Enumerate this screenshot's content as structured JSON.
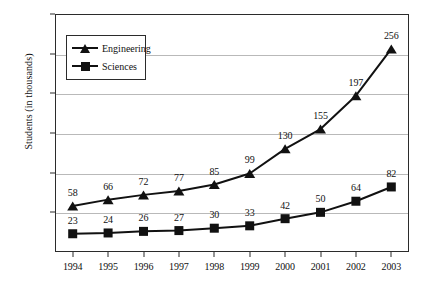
{
  "chart_data": {
    "type": "line",
    "title": "",
    "xlabel": "",
    "ylabel": "Students (in thousands)",
    "categories": [
      "1994",
      "1995",
      "1996",
      "1997",
      "1998",
      "1999",
      "2000",
      "2001",
      "2002",
      "2003"
    ],
    "series": [
      {
        "name": "Engineering",
        "marker": "triangle",
        "values": [
          58,
          66,
          72,
          77,
          85,
          99,
          130,
          155,
          197,
          256
        ]
      },
      {
        "name": "Sciences",
        "marker": "square",
        "values": [
          23,
          24,
          26,
          27,
          30,
          33,
          42,
          50,
          64,
          82
        ]
      }
    ],
    "ylim": [
      0,
      300
    ],
    "yticks": [
      50,
      100,
      150,
      200,
      250,
      300
    ],
    "ytick_labels": [
      "50",
      "100",
      "150",
      "200",
      "250",
      "300"
    ],
    "grid": true,
    "legend_position": "upper-left-inside",
    "data_labels": true,
    "colors": {
      "series": "#111111",
      "grid": "#b9b9b9",
      "axis": "#2b2b2b",
      "background": "#ffffff"
    }
  },
  "legend": {
    "entries": [
      {
        "label": "Engineering",
        "icon": "triangle-marker-icon"
      },
      {
        "label": "Sciences",
        "icon": "square-marker-icon"
      }
    ]
  }
}
